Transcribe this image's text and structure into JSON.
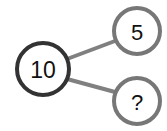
{
  "diagram": {
    "type": "number-bond",
    "background_color": "#ffffff",
    "connector_color": "#808080",
    "connector_width": 4,
    "nodes": [
      {
        "id": "whole",
        "role": "whole",
        "label": "10",
        "cx": 43,
        "cy": 69,
        "r": 26,
        "stroke": "#333333",
        "stroke_width": 4,
        "fill": "#ffffff",
        "text_color": "#111111",
        "font_size": 23
      },
      {
        "id": "part-top",
        "role": "part",
        "label": "5",
        "cx": 137,
        "cy": 31,
        "r": 23,
        "stroke": "#777777",
        "stroke_width": 4,
        "fill": "#ffffff",
        "text_color": "#111111",
        "font_size": 22
      },
      {
        "id": "part-bottom",
        "role": "part-unknown",
        "label": "?",
        "cx": 137,
        "cy": 101,
        "r": 23,
        "stroke": "#777777",
        "stroke_width": 4,
        "fill": "#ffffff",
        "text_color": "#111111",
        "font_size": 22
      }
    ],
    "connectors": [
      {
        "id": "whole-to-top",
        "from": "whole",
        "to": "part-top",
        "x1": 67,
        "y1": 59,
        "x2": 115,
        "y2": 41
      },
      {
        "id": "whole-to-bottom",
        "from": "whole",
        "to": "part-bottom",
        "x1": 67,
        "y1": 79,
        "x2": 115,
        "y2": 92
      }
    ]
  }
}
